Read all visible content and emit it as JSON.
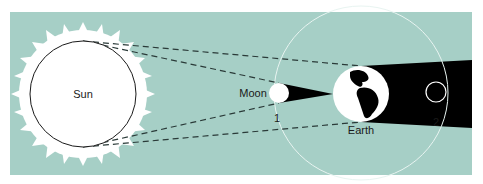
{
  "colors": {
    "background": "#a6cfc6",
    "sun": "#ffffff",
    "shadow": "#000000",
    "orbit": "#e8f4f1",
    "dash": "#2a3a38"
  },
  "bodies": {
    "sun": {
      "label": "Sun"
    },
    "moon": {
      "label": "Moon"
    },
    "earth": {
      "label": "Earth"
    }
  },
  "positions": {
    "pos1": "1",
    "pos2": "2"
  }
}
